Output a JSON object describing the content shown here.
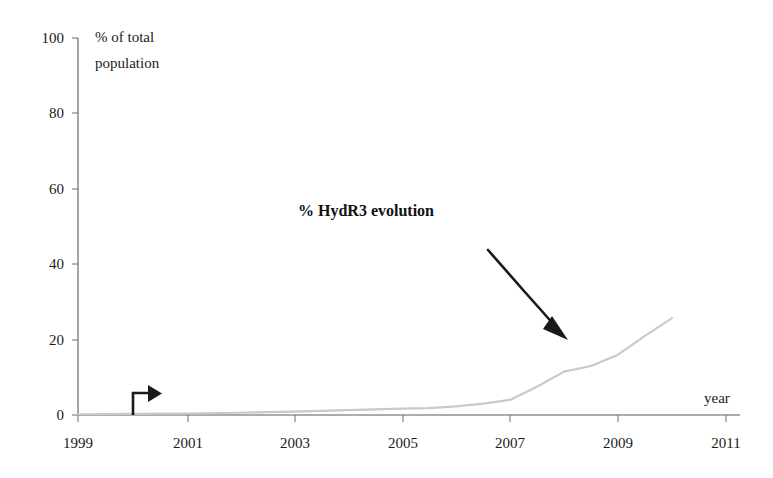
{
  "chart_data": {
    "type": "line",
    "title": "",
    "xlabel": "year",
    "ylabel": "% of total population",
    "ylabel_line1": "% of total",
    "ylabel_line2": "population",
    "xlim": [
      1999,
      2011
    ],
    "ylim": [
      0,
      100
    ],
    "grid": false,
    "legend": "none",
    "x_ticks": [
      "1999",
      "2001",
      "2003",
      "2005",
      "2007",
      "2009",
      "2011"
    ],
    "x_tick_values": [
      1999,
      2001,
      2003,
      2005,
      2007,
      2009,
      2011
    ],
    "y_ticks": [
      "0",
      "20",
      "40",
      "60",
      "80",
      "100"
    ],
    "y_tick_values": [
      0,
      20,
      40,
      60,
      80,
      100
    ],
    "series": [
      {
        "name": "% HydR3 evolution",
        "color": "#c9c9c9",
        "x": [
          1999,
          2000,
          2001,
          2002,
          2003,
          2004,
          2005,
          2005.5,
          2006,
          2006.5,
          2007,
          2007.5,
          2008,
          2008.5,
          2009,
          2009.5,
          2010
        ],
        "values": [
          0.2,
          0.3,
          0.4,
          0.6,
          0.9,
          1.3,
          1.7,
          1.8,
          2.3,
          3.0,
          4.0,
          7.5,
          11.5,
          13.0,
          16.0,
          21.0,
          25.7
        ]
      }
    ],
    "annotations": [
      {
        "name": "series-callout",
        "text": "% HydR3 evolution",
        "x_px": 298,
        "y_px": 216,
        "arrow_from_px": [
          488,
          250
        ],
        "arrow_to_px": [
          568,
          340
        ]
      },
      {
        "name": "origin-pointer",
        "text": "",
        "x_px": 133,
        "y_px": 398
      }
    ]
  },
  "axis": {
    "x_label": "year",
    "y_label_line1": "% of total",
    "y_label_line2": "population"
  },
  "callout": {
    "label": "% HydR3 evolution"
  },
  "ticks": {
    "y": [
      "100",
      "80",
      "60",
      "40",
      "20",
      "0"
    ],
    "x": [
      "1999",
      "2001",
      "2003",
      "2005",
      "2007",
      "2009",
      "2011"
    ]
  }
}
